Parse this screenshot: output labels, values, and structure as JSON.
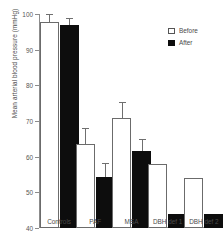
{
  "chart_data": {
    "type": "bar",
    "title": "",
    "xlabel": "",
    "ylabel": "Mean arterial blood pressure (mmHg)",
    "categories": [
      "Controls",
      "PAF",
      "MSA",
      "DBH def 1",
      "DBH def 2"
    ],
    "ylim": [
      40,
      100
    ],
    "yticks": [
      40,
      50,
      60,
      70,
      80,
      90,
      100
    ],
    "grid": false,
    "legend_position": "top-right",
    "series": [
      {
        "name": "Before",
        "fill": "#ffffff",
        "values": [
          97.7,
          63.5,
          70.8,
          58.0,
          53.9
        ],
        "errors": [
          2.4,
          4.6,
          4.6,
          null,
          null
        ]
      },
      {
        "name": "After",
        "fill": "#0d0d0d",
        "values": [
          97.0,
          54.3,
          61.6,
          44.0,
          44.0
        ],
        "errors": [
          2.0,
          4.0,
          3.3,
          null,
          null
        ]
      }
    ]
  },
  "legend": {
    "items": [
      {
        "label": "Before",
        "swatch": "open-square"
      },
      {
        "label": "After",
        "swatch": "filled-square"
      }
    ]
  },
  "axis": {
    "y_tick_labels": [
      "100",
      "90",
      "80",
      "70",
      "60",
      "50",
      "40"
    ],
    "y_title": "Mean arterial blood pressure (mmHg)"
  },
  "colors": {
    "before": "#ffffff",
    "after": "#0d0d0d",
    "axis": "#8c8c8c",
    "text": "#4a4a4a",
    "background": "#ffffff"
  }
}
